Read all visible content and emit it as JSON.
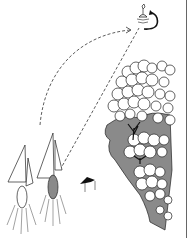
{
  "figure": {
    "type": "line-art illustration",
    "elements": [
      "sailboat-leading",
      "sailboat-trailing",
      "buoy-mark",
      "rotation-arrow",
      "curved-course-path",
      "straight-course-path",
      "tree-lined-shore",
      "wind-direction-arrow"
    ]
  },
  "colors": {
    "ink": "#111111",
    "shade": "#8a8a8a",
    "background": "#ffffff",
    "frame": "#666666"
  }
}
